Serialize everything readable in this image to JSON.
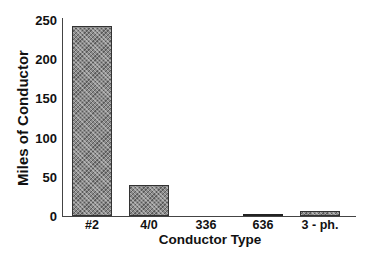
{
  "chart_data": {
    "type": "bar",
    "title": "",
    "xlabel": "Conductor Type",
    "ylabel": "Miles of Conductor",
    "categories": [
      "#2",
      "4/0",
      "336",
      "636",
      "3 - ph."
    ],
    "values": [
      242,
      39,
      0,
      2,
      6
    ],
    "ylim": [
      0,
      250
    ],
    "yticks": [
      0,
      50,
      100,
      150,
      200,
      250
    ],
    "grid": false,
    "legend": null,
    "bar_color": "#8a8a8a"
  },
  "labels": {
    "xlabel": "Conductor Type",
    "ylabel": "Miles of Conductor",
    "yticks": [
      "0",
      "50",
      "100",
      "150",
      "200",
      "250"
    ],
    "xticks": [
      "#2",
      "4/0",
      "336",
      "636",
      "3 - ph."
    ]
  }
}
